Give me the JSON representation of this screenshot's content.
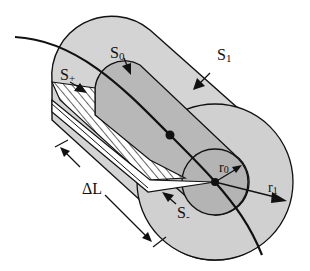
{
  "diagram": {
    "type": "cylindrical surface around a curve (tube segment)",
    "labels": {
      "s0": "S",
      "s0_sub": "0",
      "s1": "S",
      "s1_sub": "1",
      "s_plus": "S",
      "s_plus_sub": "+",
      "s_minus": "S",
      "s_minus_sub": "-",
      "delta_l": "ΔL",
      "r0": "r",
      "r0_sub": "0",
      "r1": "r",
      "r1_sub": "1"
    },
    "colors": {
      "outer_fill": "#d4d4d4",
      "inner_fill": "#b8b8b8",
      "stroke": "#111111",
      "background": "#ffffff"
    }
  }
}
